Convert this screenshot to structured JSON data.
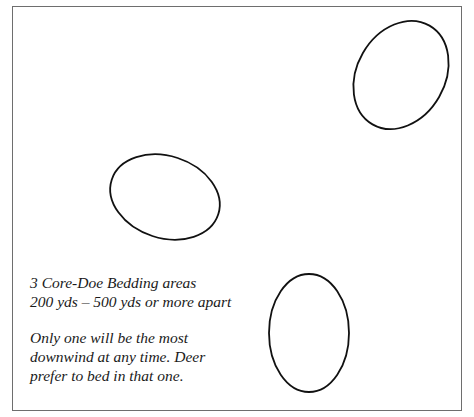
{
  "diagram": {
    "caption_group_1": {
      "lines": [
        "3 Core-Doe Bedding areas",
        "200 yds – 500 yds or more apart"
      ]
    },
    "caption_group_2": {
      "lines": [
        "Only one will be the most",
        "downwind at any time. Deer",
        "prefer to bed in that one."
      ]
    },
    "bedding_areas": [
      {
        "name": "top-right",
        "cx": 401,
        "cy": 75,
        "rx": 44,
        "ry": 56,
        "rotate": 30
      },
      {
        "name": "middle-left",
        "cx": 165,
        "cy": 197,
        "rx": 56,
        "ry": 41,
        "rotate": 18
      },
      {
        "name": "bottom",
        "cx": 309,
        "cy": 333,
        "rx": 40,
        "ry": 59,
        "rotate": 0
      }
    ],
    "colors": {
      "stroke": "#111111",
      "border": "#6e6e6e",
      "background": "#ffffff"
    }
  }
}
